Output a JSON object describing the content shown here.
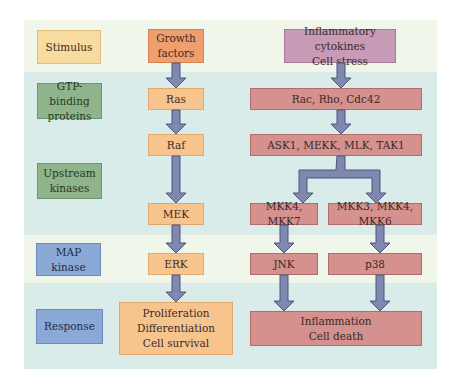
{
  "rows": {
    "stimulus": "Stimulus",
    "gtp_binding": [
      "GTP-binding",
      "proteins"
    ],
    "upstream": [
      "Upstream",
      "kinases"
    ],
    "map_kinase": [
      "MAP",
      "kinase"
    ],
    "response": "Response"
  },
  "erk_path": {
    "stimulus": [
      "Growth",
      "factors"
    ],
    "gtp": "Ras",
    "upstream1": "Raf",
    "upstream2": "MEK",
    "map": "ERK",
    "response": [
      "Proliferation",
      "Differentiation",
      "Cell survival"
    ]
  },
  "stress_path": {
    "stimulus": [
      "Inflammatory cytokines",
      "Cell stress"
    ],
    "gtp": "Rac, Rho, Cdc42",
    "upstream1": "ASK1, MEKK, MLK, TAK1",
    "upstream2_left": "MKK4, MKK7",
    "upstream2_right": "MKK3, MKK4, MKK6",
    "map_left": "JNK",
    "map_right": "p38",
    "response": [
      "Inflammation",
      "Cell death"
    ]
  },
  "colors": {
    "arrow_fill": "#8088b0",
    "arrow_stroke": "#4d5580",
    "band_light": "#f1f6ea",
    "band_teal": "#d9ecea"
  }
}
